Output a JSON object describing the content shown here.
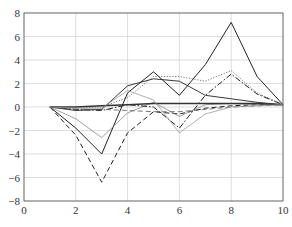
{
  "chart_data": {
    "type": "line",
    "title": "",
    "xlabel": "",
    "ylabel": "",
    "xlim": [
      0,
      10
    ],
    "ylim": [
      -8,
      8
    ],
    "xticks": [
      0,
      2,
      4,
      6,
      8,
      10
    ],
    "yticks": [
      -8,
      -6,
      -4,
      -2,
      0,
      2,
      4,
      6,
      8
    ],
    "grid": true,
    "legend": null,
    "x": [
      1,
      2,
      3,
      4,
      5,
      6,
      7,
      8,
      9,
      10
    ],
    "series": [
      {
        "name": "series-1",
        "style": "solid",
        "color": "#222222",
        "width": 1.0,
        "values": [
          0,
          -1.8,
          -4.0,
          1.2,
          3.0,
          1.0,
          3.6,
          7.2,
          2.6,
          0.2
        ]
      },
      {
        "name": "series-2",
        "style": "dashed",
        "color": "#222222",
        "width": 1.0,
        "values": [
          0,
          -2.4,
          -6.4,
          -2.2,
          -0.4,
          -0.6,
          -0.1,
          0.1,
          0.2,
          0.2
        ]
      },
      {
        "name": "series-3",
        "style": "solid",
        "color": "#888888",
        "width": 0.8,
        "values": [
          0,
          -1.0,
          -2.6,
          -0.5,
          0.4,
          -0.8,
          0.2,
          0.3,
          0.2,
          0.2
        ]
      },
      {
        "name": "series-4",
        "style": "dotted",
        "color": "#555555",
        "width": 0.8,
        "values": [
          0,
          -0.1,
          0.0,
          0.8,
          2.6,
          2.6,
          2.2,
          3.1,
          1.2,
          0.2
        ]
      },
      {
        "name": "series-5",
        "style": "dashdot",
        "color": "#222222",
        "width": 1.0,
        "values": [
          0,
          -0.2,
          -0.3,
          0.2,
          0.0,
          -1.8,
          1.0,
          2.8,
          1.1,
          0.2
        ]
      },
      {
        "name": "series-6",
        "style": "solid",
        "color": "#222222",
        "width": 0.9,
        "values": [
          0,
          -0.3,
          -0.2,
          1.8,
          2.4,
          2.2,
          1.0,
          0.7,
          0.4,
          0.2
        ]
      },
      {
        "name": "series-7",
        "style": "solid",
        "color": "#333333",
        "width": 1.6,
        "values": [
          0,
          0.0,
          0.1,
          0.2,
          0.3,
          0.3,
          0.3,
          0.3,
          0.3,
          0.2
        ]
      },
      {
        "name": "series-8",
        "style": "dashed",
        "color": "#555555",
        "width": 0.8,
        "values": [
          0,
          -0.2,
          -0.2,
          -0.3,
          -0.4,
          -0.4,
          -0.2,
          0.0,
          0.1,
          0.2
        ]
      },
      {
        "name": "series-9",
        "style": "solid",
        "color": "#999999",
        "width": 0.8,
        "values": [
          0,
          -0.1,
          -0.1,
          1.4,
          0.6,
          -2.2,
          -0.6,
          0.0,
          0.1,
          0.2
        ]
      }
    ]
  },
  "plot_box": {
    "left": 24,
    "right": 283,
    "top": 13,
    "bottom": 201
  },
  "colors": {
    "grid": "#c8c8c8",
    "frame": "#555555",
    "text": "#333333",
    "background": "#ffffff"
  }
}
